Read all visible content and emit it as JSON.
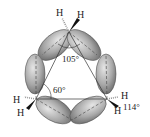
{
  "diagram": {
    "atoms": {
      "top_h_left": "H",
      "top_h_right": "H",
      "left_h_upper": "H",
      "left_h_lower": "H",
      "right_h_upper": "H",
      "right_h_lower": "H"
    },
    "angles": {
      "orbital_angle": "105°",
      "internuclear_angle": "60°",
      "hch_angle": "114°"
    },
    "colors": {
      "lobe_fill": "#9a9a9a",
      "lobe_stroke": "#555555",
      "line": "#333333"
    }
  }
}
